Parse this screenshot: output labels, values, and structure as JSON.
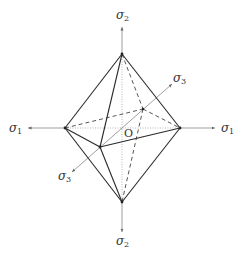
{
  "diagram": {
    "title": "",
    "type": "octahedron yield surface in principal stress space",
    "origin_label": "O",
    "axes": [
      {
        "id": "sigma2-top",
        "symbol": "σ",
        "subscript": "2",
        "direction": "up"
      },
      {
        "id": "sigma2-bottom",
        "symbol": "σ",
        "subscript": "2",
        "direction": "down"
      },
      {
        "id": "sigma1-left",
        "symbol": "σ",
        "subscript": "1",
        "direction": "left"
      },
      {
        "id": "sigma1-right",
        "symbol": "σ",
        "subscript": "1",
        "direction": "right"
      },
      {
        "id": "sigma3-back",
        "symbol": "σ",
        "subscript": "3",
        "direction": "upper-right"
      },
      {
        "id": "sigma3-front",
        "symbol": "σ",
        "subscript": "3",
        "direction": "lower-left"
      }
    ],
    "vertices": {
      "top": [
        122,
        54
      ],
      "bottom": [
        122,
        202
      ],
      "left": [
        65,
        128
      ],
      "right": [
        180,
        128
      ],
      "front": [
        100,
        147
      ],
      "back": [
        143,
        109
      ],
      "origin": [
        122,
        128
      ]
    },
    "colors": {
      "solid_edge": "#2a2a2a",
      "hidden_edge": "#444444",
      "axis": "#777777",
      "text": "#333333"
    }
  }
}
